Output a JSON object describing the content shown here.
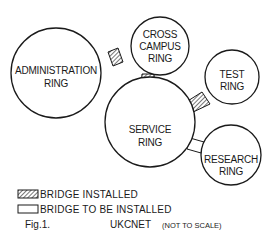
{
  "title": "UKCNET",
  "rings": [
    {
      "id": "administration",
      "lines": [
        "ADMINISTRATION",
        "RING"
      ]
    },
    {
      "id": "cross-campus",
      "lines": [
        "CROSS",
        "CAMPUS",
        "RING"
      ]
    },
    {
      "id": "test",
      "lines": [
        "TEST",
        "RING"
      ]
    },
    {
      "id": "service",
      "lines": [
        "SERVICE",
        "RING"
      ]
    },
    {
      "id": "research",
      "lines": [
        "RESEARCH",
        "RING"
      ]
    }
  ],
  "bridges": [
    {
      "from": "administration",
      "to": "cross-campus",
      "status": "installed"
    },
    {
      "from": "cross-campus",
      "to": "service",
      "status": "installed"
    },
    {
      "from": "test",
      "to": "service",
      "status": "installed"
    },
    {
      "from": "service",
      "to": "research",
      "status": "to be installed"
    }
  ],
  "legend": {
    "installed": "BRIDGE INSTALLED",
    "planned": "BRIDGE TO BE INSTALLED"
  },
  "caption": {
    "fig": "Fig.1.",
    "name": "UKCNET",
    "note": "(NOT TO SCALE)"
  }
}
